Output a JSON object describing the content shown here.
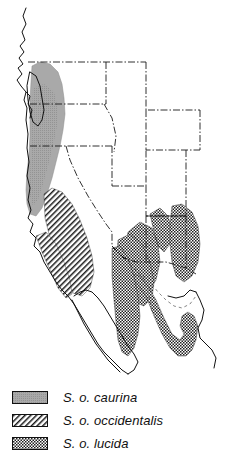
{
  "figure": {
    "kind": "range-map",
    "region": "Western North America",
    "background_color": "#ffffff",
    "line_color": "#111111"
  },
  "map": {
    "coastline_name": "pacific-coast-outline",
    "border_style": "dash-dot",
    "features": [
      {
        "name": "pacific-coastline",
        "type": "outline"
      },
      {
        "name": "vancouver-island",
        "type": "outline"
      },
      {
        "name": "puget-sound",
        "type": "outline"
      },
      {
        "name": "baja-california-peninsula",
        "type": "outline"
      },
      {
        "name": "gulf-of-california",
        "type": "outline"
      },
      {
        "name": "state-boundaries",
        "type": "dash-dot-lines"
      },
      {
        "name": "mexico-boundary",
        "type": "dash-dot-line"
      }
    ]
  },
  "ranges": [
    {
      "id": "caurina",
      "label": "S. o. caurina",
      "pattern": "solid-gray",
      "color": "#a9a9a9",
      "area": "Pacific Northwest coastal ranges and Cascades"
    },
    {
      "id": "occidentalis",
      "label": "S. o. occidentalis",
      "pattern": "diagonal-hatch",
      "color": "#111111",
      "area": "California Sierra Nevada and coastal ranges"
    },
    {
      "id": "lucida",
      "label": "S. o. lucida",
      "pattern": "stipple-dots",
      "color": "#111111",
      "area": "Southwest US and Sierra Madre Occidental"
    }
  ],
  "legend": {
    "name": "subspecies-legend",
    "entries": [
      {
        "swatch": "caurina-swatch",
        "label": "S. o. caurina"
      },
      {
        "swatch": "occidentalis-swatch",
        "label": "S. o. occidentalis"
      },
      {
        "swatch": "lucida-swatch",
        "label": "S. o. lucida"
      }
    ]
  }
}
